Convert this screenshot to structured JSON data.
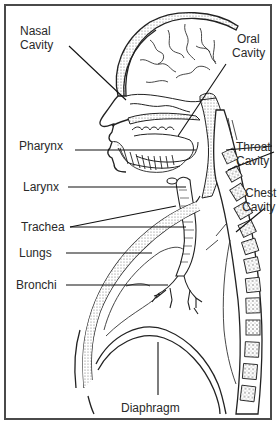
{
  "diagram": {
    "labels": {
      "nasal_cavity": {
        "line1": "Nasal",
        "line2": "Cavity"
      },
      "oral_cavity": {
        "line1": "Oral",
        "line2": "Cavity"
      },
      "pharynx": "Pharynx",
      "throat_cavity": {
        "line1": "Throat",
        "line2": "Cavity"
      },
      "larynx": "Larynx",
      "chest_cavity": {
        "line1": "Chest",
        "line2": "Cavity"
      },
      "trachea": "Trachea",
      "lungs": "Lungs",
      "bronchi": "Bronchi",
      "diaphragm": "Diaphragm"
    },
    "colors": {
      "line": "#1a1a1a",
      "text": "#2a2a2a",
      "border": "#4a4a4a",
      "stipple": "#9a9a9a",
      "background": "#ffffff"
    }
  }
}
